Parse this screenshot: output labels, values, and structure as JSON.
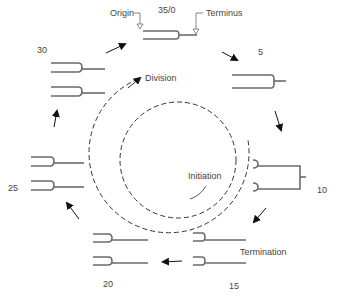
{
  "diagram": {
    "type": "replication cycle",
    "stages": [
      {
        "label": "35/0",
        "x": 157,
        "y": 6
      },
      {
        "label": "5",
        "x": 258,
        "y": 48
      },
      {
        "label": "10",
        "x": 317,
        "y": 186
      },
      {
        "label": "15",
        "x": 230,
        "y": 283
      },
      {
        "label": "20",
        "x": 103,
        "y": 281
      },
      {
        "label": "25",
        "x": 8,
        "y": 186
      },
      {
        "label": "30",
        "x": 37,
        "y": 47
      }
    ],
    "annotations": {
      "origin": "Origin",
      "terminus": "Terminus",
      "division": "Division",
      "initiation": "Initiation",
      "termination": "Termination"
    },
    "colors": {
      "strand": "#6b6b6b",
      "arrow": "#111111",
      "dashed": "#333333",
      "text": "#444444"
    }
  }
}
